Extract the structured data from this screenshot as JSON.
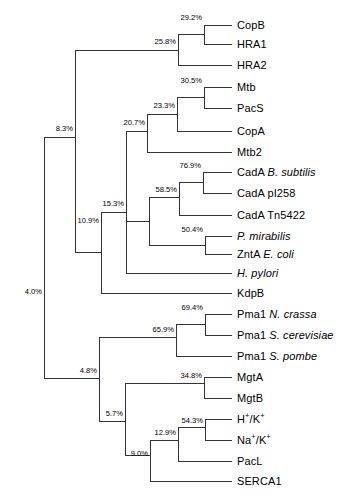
{
  "figure": {
    "type": "phylogenetic-tree",
    "orientation": "left-to-right-rectangular",
    "line_color": "#333333",
    "text_color": "#000000",
    "background": "#ffffff",
    "width": 346,
    "height": 502
  },
  "tips": [
    {
      "id": "copb",
      "text": "CopB",
      "plain": "CopB",
      "italic": "",
      "sup": "",
      "x": 232,
      "y": 25,
      "label_x": 237
    },
    {
      "id": "hra1",
      "text": "HRA1",
      "plain": "HRA1",
      "italic": "",
      "sup": "",
      "x": 232,
      "y": 44,
      "label_x": 237
    },
    {
      "id": "hra2",
      "text": "HRA2",
      "plain": "HRA2",
      "italic": "",
      "sup": "",
      "x": 232,
      "y": 65,
      "label_x": 237
    },
    {
      "id": "mtb",
      "text": "Mtb",
      "plain": "Mtb",
      "italic": "",
      "sup": "",
      "x": 232,
      "y": 87,
      "label_x": 237
    },
    {
      "id": "pacs",
      "text": "PacS",
      "plain": "PacS",
      "italic": "",
      "sup": "",
      "x": 232,
      "y": 108,
      "label_x": 237
    },
    {
      "id": "copa",
      "text": "CopA",
      "plain": "CopA",
      "italic": "",
      "sup": "",
      "x": 232,
      "y": 131,
      "label_x": 237
    },
    {
      "id": "mtb2",
      "text": "Mtb2",
      "plain": "Mtb2",
      "italic": "",
      "sup": "",
      "x": 232,
      "y": 152,
      "label_x": 237
    },
    {
      "id": "cada-bsub",
      "text": "CadA B. subtilis",
      "plain": "CadA ",
      "italic": "B. subtilis",
      "sup": "",
      "x": 232,
      "y": 172,
      "label_x": 237
    },
    {
      "id": "cada-pi258",
      "text": "CadA pI258",
      "plain": "CadA pI258",
      "italic": "",
      "sup": "",
      "x": 232,
      "y": 193,
      "label_x": 237
    },
    {
      "id": "cada-tn5422",
      "text": "CadA Tn5422",
      "plain": "CadA Tn5422",
      "italic": "",
      "sup": "",
      "x": 232,
      "y": 215,
      "label_x": 237
    },
    {
      "id": "p-mirabilis",
      "text": "P. mirabilis",
      "plain": "",
      "italic": "P. mirabilis",
      "sup": "",
      "x": 232,
      "y": 236,
      "label_x": 237
    },
    {
      "id": "znta-ecoli",
      "text": "ZntA E. coli",
      "plain": "ZntA ",
      "italic": "E. coli",
      "sup": "",
      "x": 232,
      "y": 254,
      "label_x": 237
    },
    {
      "id": "h-pylori",
      "text": "H. pylori",
      "plain": "",
      "italic": "H. pylori",
      "sup": "",
      "x": 232,
      "y": 273,
      "label_x": 237
    },
    {
      "id": "kdpb",
      "text": "KdpB",
      "plain": "KdpB",
      "italic": "",
      "sup": "",
      "x": 232,
      "y": 293,
      "label_x": 237
    },
    {
      "id": "pma1-ncrassa",
      "text": "Pma1 N. crassa",
      "plain": "Pma1 ",
      "italic": "N. crassa",
      "sup": "",
      "x": 232,
      "y": 314,
      "label_x": 237
    },
    {
      "id": "pma1-scerev",
      "text": "Pma1 S. cerevisiae",
      "plain": "Pma1 ",
      "italic": "S. cerevisiae",
      "sup": "",
      "x": 232,
      "y": 335,
      "label_x": 237
    },
    {
      "id": "pma1-spombe",
      "text": "Pma1 S. pombe",
      "plain": "Pma1 ",
      "italic": "S. pombe",
      "sup": "",
      "x": 232,
      "y": 356,
      "label_x": 237
    },
    {
      "id": "mgta",
      "text": "MgtA",
      "plain": "MgtA",
      "italic": "",
      "sup": "",
      "x": 232,
      "y": 377,
      "label_x": 237
    },
    {
      "id": "mgtb",
      "text": "MgtB",
      "plain": "MgtB",
      "italic": "",
      "sup": "",
      "x": 232,
      "y": 398,
      "label_x": 237
    },
    {
      "id": "h-k",
      "text": "H+/K+",
      "plain": "",
      "italic": "",
      "sup": "hk",
      "x": 232,
      "y": 419,
      "label_x": 237
    },
    {
      "id": "na-k",
      "text": "Na+/K+",
      "plain": "",
      "italic": "",
      "sup": "nak",
      "x": 232,
      "y": 440,
      "label_x": 237
    },
    {
      "id": "pacl",
      "text": "PacL",
      "plain": "PacL",
      "italic": "",
      "sup": "",
      "x": 232,
      "y": 461,
      "label_x": 237
    },
    {
      "id": "serca1",
      "text": "SERCA1",
      "plain": "SERCA1",
      "italic": "",
      "sup": "",
      "x": 232,
      "y": 481,
      "label_x": 237
    }
  ],
  "nodes": [
    {
      "id": "n-29-2",
      "label": "29.2%",
      "x": 204,
      "y_top": 25,
      "y_bot": 44,
      "y_mid": 34,
      "parent_x": 178,
      "label_x": 202,
      "label_y": 22
    },
    {
      "id": "n-25-8",
      "label": "25.8%",
      "x": 178,
      "y_top": 34,
      "y_bot": 65,
      "y_mid": 50,
      "parent_x": 75,
      "label_x": 176,
      "label_y": 46
    },
    {
      "id": "n-30-5",
      "label": "30.5%",
      "x": 204,
      "y_top": 87,
      "y_bot": 108,
      "y_mid": 97,
      "parent_x": 177,
      "label_x": 202,
      "label_y": 85
    },
    {
      "id": "n-23-3",
      "label": "23.3%",
      "x": 177,
      "y_top": 97,
      "y_bot": 131,
      "y_mid": 114,
      "parent_x": 147,
      "label_x": 175,
      "label_y": 110
    },
    {
      "id": "n-20-7",
      "label": "20.7%",
      "x": 147,
      "y_top": 114,
      "y_bot": 152,
      "y_mid": 131,
      "parent_x": 126,
      "label_x": 145,
      "label_y": 127
    },
    {
      "id": "n-76-9",
      "label": "76.9%",
      "x": 203,
      "y_top": 172,
      "y_bot": 193,
      "y_mid": 182,
      "parent_x": 179,
      "label_x": 201,
      "label_y": 170
    },
    {
      "id": "n-58-5",
      "label": "58.5%",
      "x": 179,
      "y_top": 182,
      "y_bot": 215,
      "y_mid": 197,
      "parent_x": 149,
      "label_x": 177,
      "label_y": 194
    },
    {
      "id": "n-50-4",
      "label": "50.4%",
      "x": 205,
      "y_top": 236,
      "y_bot": 254,
      "y_mid": 245,
      "parent_x": 149,
      "label_x": 203,
      "label_y": 234
    },
    {
      "id": "n-inner1",
      "label": "",
      "x": 149,
      "y_top": 197,
      "y_bot": 245,
      "y_mid": 221,
      "parent_x": 126,
      "label_x": 0,
      "label_y": 0
    },
    {
      "id": "n-15-3",
      "label": "15.3%",
      "x": 126,
      "y_top": 131,
      "y_bot": 273,
      "y_mid": 212,
      "parent_x": 101,
      "label_x": 124,
      "label_y": 208
    },
    {
      "id": "n-10-9",
      "label": "10.9%",
      "x": 101,
      "y_top": 212,
      "y_bot": 293,
      "y_mid": 252,
      "parent_x": 75,
      "label_x": 99,
      "label_y": 225
    },
    {
      "id": "n-8-3",
      "label": "8.3%",
      "x": 75,
      "y_top": 50,
      "y_bot": 252,
      "y_mid": 137,
      "parent_x": 44,
      "label_x": 73,
      "label_y": 133
    },
    {
      "id": "n-69-4",
      "label": "69.4%",
      "x": 205,
      "y_top": 314,
      "y_bot": 335,
      "y_mid": 324,
      "parent_x": 176,
      "label_x": 203,
      "label_y": 312
    },
    {
      "id": "n-65-9",
      "label": "65.9%",
      "x": 176,
      "y_top": 324,
      "y_bot": 356,
      "y_mid": 337,
      "parent_x": 99,
      "label_x": 174,
      "label_y": 334
    },
    {
      "id": "n-34-8",
      "label": "34.8%",
      "x": 204,
      "y_top": 377,
      "y_bot": 398,
      "y_mid": 383,
      "parent_x": 125,
      "label_x": 202,
      "label_y": 380
    },
    {
      "id": "n-54-3",
      "label": "54.3%",
      "x": 205,
      "y_top": 419,
      "y_bot": 440,
      "y_mid": 427,
      "parent_x": 178,
      "label_x": 203,
      "label_y": 425
    },
    {
      "id": "n-12-9",
      "label": "12.9%",
      "x": 178,
      "y_top": 427,
      "y_bot": 461,
      "y_mid": 440,
      "parent_x": 150,
      "label_x": 176,
      "label_y": 437
    },
    {
      "id": "n-9-0",
      "label": "9.0%",
      "x": 150,
      "y_top": 440,
      "y_bot": 481,
      "y_mid": 455,
      "parent_x": 125,
      "label_x": 148,
      "label_y": 458
    },
    {
      "id": "n-5-7",
      "label": "5.7%",
      "x": 125,
      "y_top": 383,
      "y_bot": 455,
      "y_mid": 421,
      "parent_x": 99,
      "label_x": 123,
      "label_y": 418
    },
    {
      "id": "n-4-8",
      "label": "4.8%",
      "x": 99,
      "y_top": 337,
      "y_bot": 421,
      "y_mid": 378,
      "parent_x": 44,
      "label_x": 97,
      "label_y": 375
    },
    {
      "id": "n-4-0",
      "label": "4.0%",
      "x": 44,
      "y_top": 137,
      "y_bot": 378,
      "y_mid": 258,
      "parent_x": 44,
      "label_x": 42,
      "label_y": 296
    }
  ],
  "chart_data": {
    "type": "tree",
    "title": "",
    "xlabel": "",
    "ylabel": "",
    "support_values_unit": "%",
    "taxa": [
      "CopB",
      "HRA1",
      "HRA2",
      "Mtb",
      "PacS",
      "CopA",
      "Mtb2",
      "CadA B. subtilis",
      "CadA pI258",
      "CadA Tn5422",
      "P. mirabilis",
      "ZntA E. coli",
      "H. pylori",
      "KdpB",
      "Pma1 N. crassa",
      "Pma1 S. cerevisiae",
      "Pma1 S. pombe",
      "MgtA",
      "MgtB",
      "H+/K+",
      "Na+/K+",
      "PacL",
      "SERCA1"
    ],
    "support_values": [
      {
        "node": "CopB+HRA1",
        "value": 29.2
      },
      {
        "node": "(CopB,HRA1)+HRA2",
        "value": 25.8
      },
      {
        "node": "Mtb+PacS",
        "value": 30.5
      },
      {
        "node": "(Mtb,PacS)+CopA",
        "value": 23.3
      },
      {
        "node": "((Mtb,PacS),CopA)+Mtb2",
        "value": 20.7
      },
      {
        "node": "CadA B. subtilis+CadA pI258",
        "value": 76.9
      },
      {
        "node": "(CadA B. subtilis,CadA pI258)+CadA Tn5422",
        "value": 58.5
      },
      {
        "node": "P. mirabilis+ZntA E. coli",
        "value": 50.4
      },
      {
        "node": "CadA clade+ZntA clade+H. pylori",
        "value": 15.3
      },
      {
        "node": "P-type clade+KdpB",
        "value": 10.9
      },
      {
        "node": "25.8 clade + 10.9 clade",
        "value": 8.3
      },
      {
        "node": "Pma1 N. crassa+Pma1 S. cerevisiae",
        "value": 69.4
      },
      {
        "node": "Pma1 clade+Pma1 S. pombe",
        "value": 65.9
      },
      {
        "node": "MgtA+MgtB",
        "value": 34.8
      },
      {
        "node": "H+/K+ + Na+/K+",
        "value": 54.3
      },
      {
        "node": "(H+/K+,Na+/K+)+PacL",
        "value": 12.9
      },
      {
        "node": "12.9 clade + SERCA1",
        "value": 9.0
      },
      {
        "node": "MgtA/MgtB clade + 9.0 clade",
        "value": 5.7
      },
      {
        "node": "Pma1 clade + 5.7 clade",
        "value": 4.8
      },
      {
        "node": "root",
        "value": 4.0
      }
    ]
  }
}
